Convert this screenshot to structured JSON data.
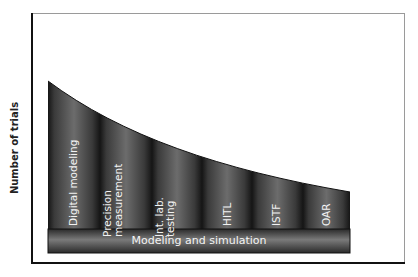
{
  "diagram": {
    "y_axis_label": "Number of trials",
    "base_bar_label": "Modeling and simulation",
    "columns": [
      {
        "label_line1": "Digital modeling",
        "label_line2": ""
      },
      {
        "label_line1": "Precision",
        "label_line2": "measurement"
      },
      {
        "label_line1": "Int. lab.",
        "label_line2": "testing"
      },
      {
        "label_line1": "HITL",
        "label_line2": ""
      },
      {
        "label_line1": "ISTF",
        "label_line2": ""
      },
      {
        "label_line1": "OAR",
        "label_line2": ""
      }
    ],
    "colors": {
      "column_dark": "#141414",
      "column_light": "#6e6e6e",
      "frame": "#111111",
      "frame_light": "#9a9a9a",
      "label_text": "#f2f2f2"
    }
  }
}
